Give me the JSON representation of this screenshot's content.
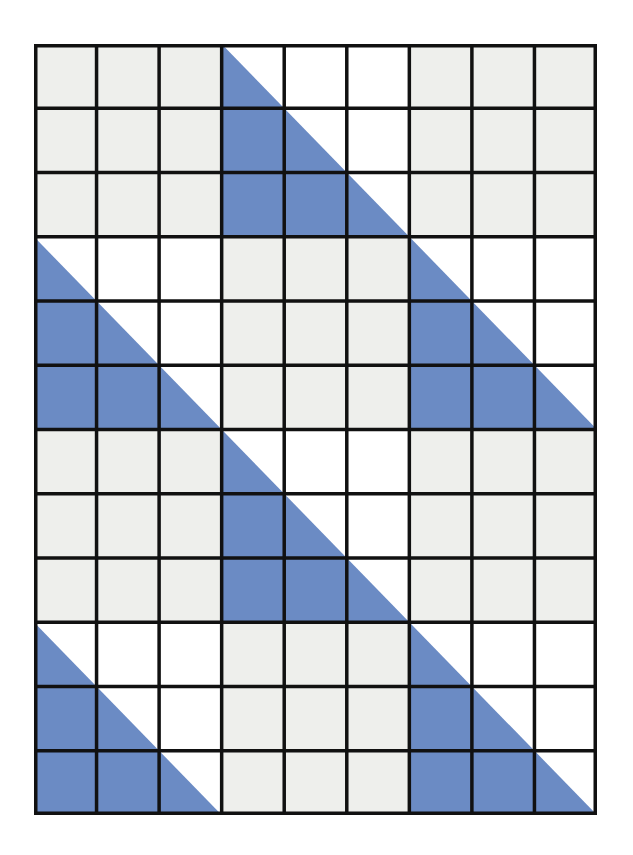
{
  "diagram": {
    "title": "Grid of 3x3 blocks with alternating shaded triangles",
    "grid": {
      "columns": 9,
      "rows": 12,
      "block_size": 3,
      "block_columns": 3,
      "block_rows": 4,
      "origin_x": 34,
      "origin_y": 44,
      "width": 563,
      "height": 771
    },
    "colors": {
      "plain_block_fill": "#EEEFEC",
      "triangle_block_background": "#FFFFFF",
      "triangle_fill": "#6B8BC4",
      "grid_line": "#111111"
    },
    "line_width": 3.5,
    "block_pattern": [
      [
        "plain",
        "triangle",
        "plain"
      ],
      [
        "triangle",
        "plain",
        "triangle"
      ],
      [
        "plain",
        "triangle",
        "plain"
      ],
      [
        "triangle",
        "plain",
        "triangle"
      ]
    ],
    "triangle_orientation": "lower-left (right angle at bottom-left corner of each 3x3 block, hypotenuse from top-left to bottom-right)"
  }
}
